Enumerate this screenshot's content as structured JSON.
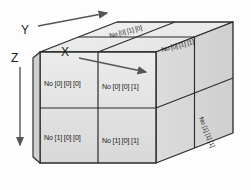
{
  "figure": {
    "background_color": "#fdfdfd"
  },
  "axes": [
    {
      "name": "Y",
      "label": "Y",
      "direction": "up-right",
      "arrow": "arrow-icon"
    },
    {
      "name": "X",
      "label": "X",
      "direction": "right",
      "arrow": "arrow-icon"
    },
    {
      "name": "Z",
      "label": "Z",
      "direction": "down",
      "arrow": "arrow-icon"
    }
  ],
  "cube": {
    "front_face": {
      "cells": [
        {
          "label": "No [0] [0] [0]",
          "row": 0,
          "col": 0
        },
        {
          "label": "No [0] [0] [1]",
          "row": 0,
          "col": 1
        },
        {
          "label": "No [1] [0] [0]",
          "row": 1,
          "col": 0
        },
        {
          "label": "No [1] [0] [1]",
          "row": 1,
          "col": 1
        }
      ]
    },
    "top_face": {
      "cells": [
        {
          "label": "No [0] [1] [0]",
          "row": 0,
          "col": 0
        },
        {
          "label": "No [0] [1] [1]",
          "row": 0,
          "col": 1
        }
      ]
    },
    "right_face": {
      "cells": [
        {
          "label": "No [1] [1] [1]",
          "row": 1,
          "col": 0
        }
      ]
    }
  },
  "colors": {
    "face_front": "#e3e3e3",
    "face_top": "#ededed",
    "face_right": "#d6d6d6",
    "edge": "#2b2b2b",
    "text": "#1a1a1a",
    "arrow": "#555555"
  }
}
